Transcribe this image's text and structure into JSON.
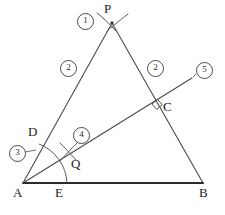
{
  "figure": {
    "type": "geometry-construction-diagram",
    "background_color": "#ffffff",
    "stroke_color": "#3a3a3a",
    "heavy_stroke_color": "#2b2b2b",
    "label_color": "#1a1a1a"
  },
  "points": {
    "A": {
      "label": "A",
      "x": 23,
      "y": 183,
      "label_x": 13,
      "label_y": 186
    },
    "B": {
      "label": "B",
      "x": 203,
      "y": 183,
      "label_x": 199,
      "label_y": 186
    },
    "C": {
      "label": "C",
      "x": 159,
      "y": 110,
      "label_x": 163,
      "label_y": 100
    },
    "D": {
      "label": "D",
      "x": 40,
      "y": 152,
      "label_x": 28,
      "label_y": 125
    },
    "E": {
      "label": "E",
      "x": 57,
      "y": 183,
      "label_x": 55,
      "label_y": 186
    },
    "P": {
      "label": "P",
      "x": 112,
      "y": 23,
      "label_x": 104,
      "label_y": 2
    },
    "Q": {
      "label": "Q",
      "x": 68,
      "y": 152,
      "label_x": 71,
      "label_y": 157
    }
  },
  "steps": [
    {
      "label": "①",
      "number": 1,
      "x": 77,
      "y": 13,
      "describes": "arc-intersection-at-P"
    },
    {
      "label": "②",
      "number": 2,
      "x": 60,
      "y": 60,
      "describes": "segment-A-to-P"
    },
    {
      "label": "②",
      "number": 2,
      "x": 147,
      "y": 60,
      "describes": "segment-P-to-B"
    },
    {
      "label": "③",
      "number": 3,
      "x": 9,
      "y": 145,
      "describes": "arc-centered-at-A-through-D-and-E"
    },
    {
      "label": "④",
      "number": 4,
      "x": 73,
      "y": 127,
      "describes": "arc-intersection-at-Q"
    },
    {
      "label": "⑤",
      "number": 5,
      "x": 196,
      "y": 62,
      "describes": "ray-A-through-Q-through-C"
    }
  ],
  "segments": [
    {
      "name": "base-AB",
      "from": "A",
      "to": "B",
      "weight": "heavy"
    },
    {
      "name": "side-AP",
      "from": "A",
      "to": "P",
      "weight": "normal"
    },
    {
      "name": "side-PB",
      "from": "P",
      "to": "B",
      "weight": "normal"
    },
    {
      "name": "ray-AC5",
      "from": "A",
      "to": "ray-end",
      "weight": "normal"
    }
  ],
  "markers": {
    "right_angle": {
      "name": "right-angle-at-C",
      "x": 159,
      "y": 110,
      "size": 8
    },
    "cross_P": {
      "name": "compass-cross-at-P",
      "x": 112,
      "y": 23
    },
    "cross_Q": {
      "name": "compass-cross-at-Q",
      "x": 68,
      "y": 152
    },
    "arc_A": {
      "name": "angle-arc-centered-at-A",
      "center": "A",
      "radius": 42
    }
  },
  "ray_end": {
    "x": 192,
    "y": 78
  }
}
